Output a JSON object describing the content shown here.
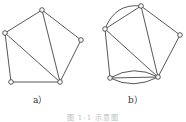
{
  "figures": [
    {
      "label": "a）",
      "nodes": [
        {
          "id": "top",
          "x": 42,
          "y": 10
        },
        {
          "id": "left",
          "x": 5,
          "y": 33
        },
        {
          "id": "right",
          "x": 81,
          "y": 40
        },
        {
          "id": "bottom-left",
          "x": 11,
          "y": 82
        },
        {
          "id": "bottom-right",
          "x": 60,
          "y": 82
        }
      ],
      "edges": [
        [
          "top",
          "left"
        ],
        [
          "top",
          "right"
        ],
        [
          "top",
          "bottom-right"
        ],
        [
          "left",
          "bottom-right"
        ],
        [
          "left",
          "bottom-left"
        ],
        [
          "right",
          "bottom-right"
        ],
        [
          "bottom-left",
          "bottom-right"
        ]
      ]
    },
    {
      "label": "b）",
      "nodes": [
        {
          "id": "top",
          "x": 141,
          "y": 6
        },
        {
          "id": "left",
          "x": 105,
          "y": 29
        },
        {
          "id": "right",
          "x": 180,
          "y": 35
        },
        {
          "id": "bottom-left",
          "x": 110,
          "y": 78
        },
        {
          "id": "bottom-right",
          "x": 158,
          "y": 77
        }
      ],
      "edges": [
        [
          "top",
          "left"
        ],
        [
          "top",
          "right"
        ],
        [
          "top",
          "bottom-right"
        ],
        [
          "left",
          "bottom-right"
        ],
        [
          "left",
          "bottom-left"
        ],
        [
          "right",
          "bottom-right"
        ],
        [
          "bottom-left",
          "bottom-right"
        ]
      ],
      "parallel_edges": [
        [
          "top",
          "left"
        ],
        [
          "bottom-left",
          "bottom-right"
        ],
        [
          "bottom-left",
          "bottom-right"
        ]
      ]
    }
  ],
  "caption": "图 1-1 示意图"
}
